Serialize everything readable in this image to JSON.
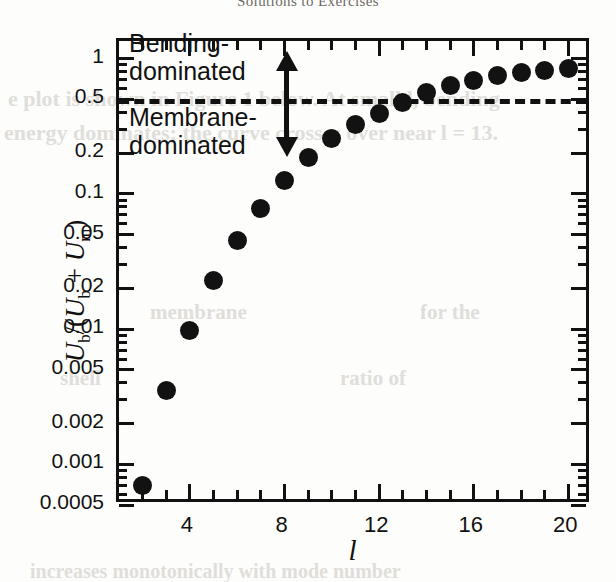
{
  "page": {
    "running_head": "Solutions to Exercises",
    "bleed_through_lines": [
      {
        "text": "e plot is shown in Figure 1 below. At small l, bending",
        "x": 8,
        "y": 86,
        "size": 22
      },
      {
        "text": "energy dominates; the curve crosses over near l = 13.",
        "x": 4,
        "y": 120,
        "size": 22
      },
      {
        "text": "membrane",
        "x": 150,
        "y": 300,
        "size": 21
      },
      {
        "text": "for the",
        "x": 420,
        "y": 300,
        "size": 21
      },
      {
        "text": "shell",
        "x": 60,
        "y": 366,
        "size": 21
      },
      {
        "text": "ratio of",
        "x": 340,
        "y": 366,
        "size": 21
      },
      {
        "text": "increases monotonically with mode number",
        "x": 30,
        "y": 560,
        "size": 20
      }
    ]
  },
  "chart_data": {
    "type": "scatter",
    "title": "",
    "xlabel": "l",
    "ylabel": "U_b/(U_b + U_m)",
    "ylabel_parts": {
      "numerator_symbol": "U",
      "numerator_sub": "b",
      "denominator_symbol_1": "U",
      "denominator_sub_1": "b",
      "denominator_symbol_2": "U",
      "denominator_sub_2": "m"
    },
    "xscale": "linear",
    "yscale": "log",
    "xlim": [
      1,
      21
    ],
    "ylim": [
      0.0005,
      1.35
    ],
    "grid": false,
    "legend": null,
    "x_major_ticks": [
      4,
      8,
      12,
      16,
      20
    ],
    "x_major_tick_labels": [
      "4",
      "8",
      "12",
      "16",
      "20"
    ],
    "x_minor_ticks": [
      2,
      3,
      5,
      6,
      7,
      9,
      10,
      11,
      13,
      14,
      15,
      17,
      18,
      19
    ],
    "y_major_ticks": [
      1,
      0.5,
      0.2,
      0.1,
      0.05,
      0.02,
      0.01,
      0.005,
      0.002,
      0.001,
      0.0005
    ],
    "y_major_tick_labels": [
      "1",
      "0.5",
      "0.2",
      "0.1",
      "0.05",
      "0.02",
      "0.01",
      "0.005",
      "0.002",
      "0.001",
      "0.0005"
    ],
    "x": [
      2,
      3,
      4,
      5,
      6,
      7,
      8,
      9,
      10,
      11,
      12,
      13,
      14,
      15,
      16,
      17,
      18,
      19,
      20
    ],
    "values": [
      0.0007,
      0.0035,
      0.0098,
      0.023,
      0.045,
      0.078,
      0.125,
      0.185,
      0.255,
      0.325,
      0.395,
      0.47,
      0.56,
      0.63,
      0.69,
      0.745,
      0.785,
      0.82,
      0.85
    ],
    "marker": "filled-circle",
    "marker_color": "#121212",
    "marker_size_px": 19,
    "threshold": {
      "value": 0.5,
      "style": "dashed",
      "color": "#111111"
    },
    "annotations": [
      {
        "name": "bending-dominated-label",
        "text_line_1": "Bending-",
        "text_line_2": "dominated",
        "region": "above-threshold"
      },
      {
        "name": "membrane-dominated-label",
        "text_line_1": "Membrane-",
        "text_line_2": "dominated",
        "region": "below-threshold"
      },
      {
        "name": "regime-arrow",
        "type": "double-headed-vertical-arrow",
        "spans": "across-threshold"
      }
    ]
  }
}
